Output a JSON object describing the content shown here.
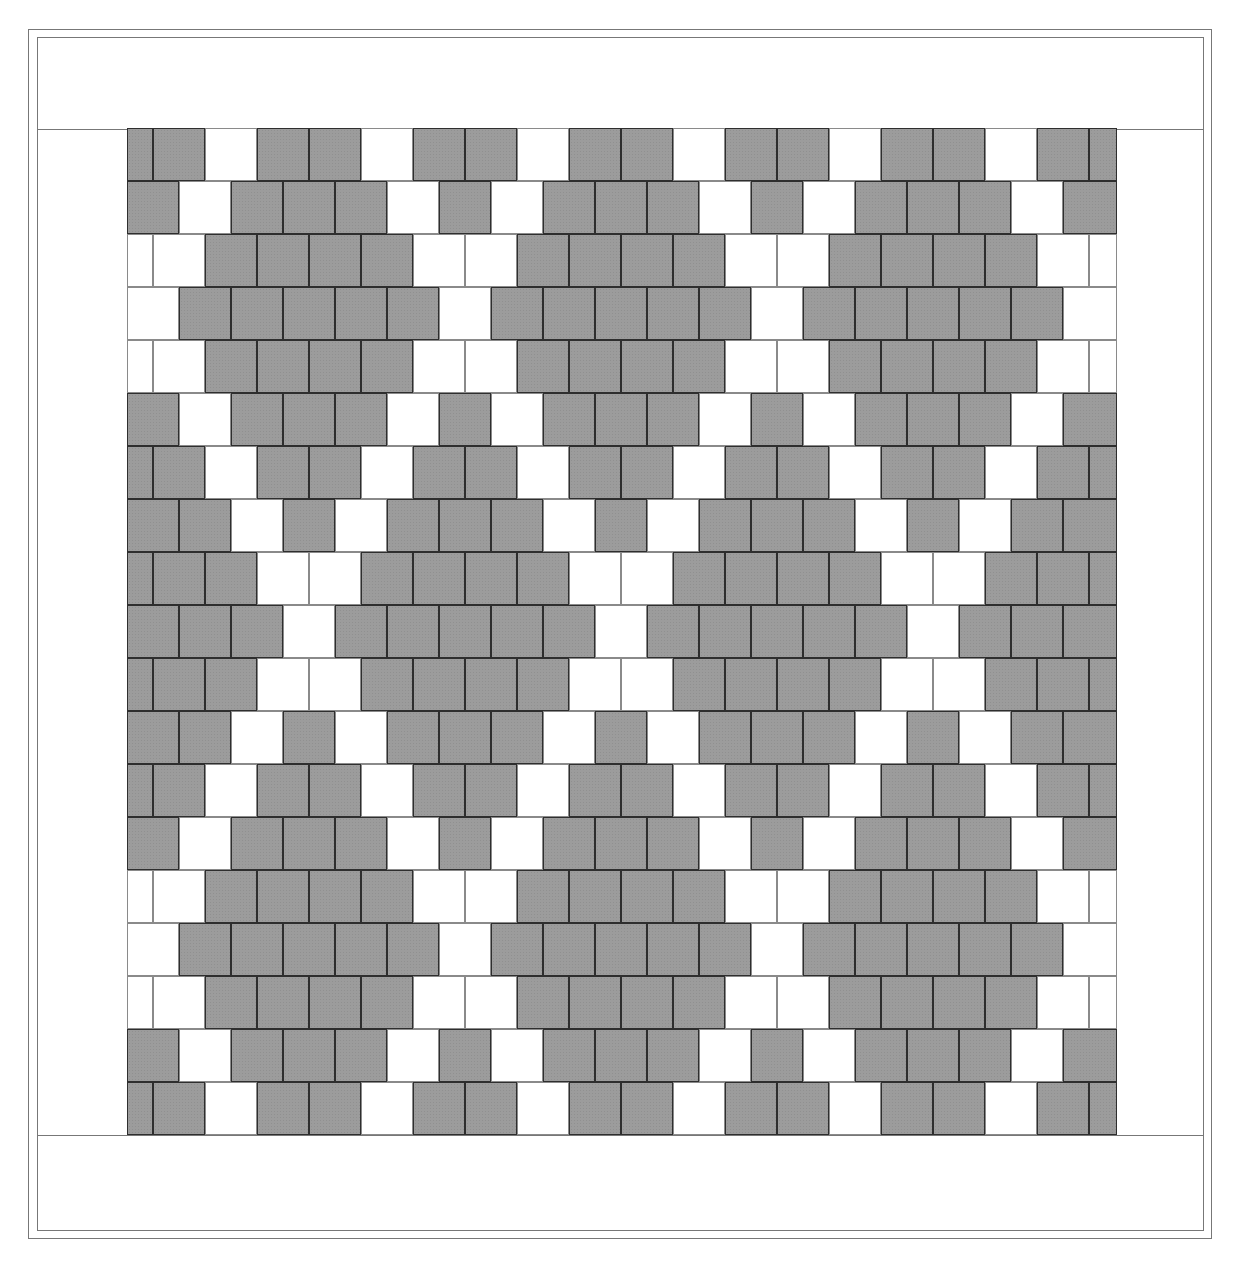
{
  "diagram": {
    "type": "tile-pattern",
    "legend": {
      "G": {
        "name": "gray tile",
        "color": "#9c9c9c"
      },
      "W": {
        "name": "white tile",
        "color": "#ffffff"
      }
    },
    "grid": {
      "row_count": 19,
      "rows": [
        {
          "half_start": true,
          "tiles": "GGWGGWGGWGGWGGWGGWGG"
        },
        {
          "half_start": false,
          "tiles": "GWGGGWGWGGGWGWGGGWG"
        },
        {
          "half_start": true,
          "tiles": "WWGGGGWWGGGGWWGGGGWW"
        },
        {
          "half_start": false,
          "tiles": "WGGGGGWGGGGGWGGGGGW"
        },
        {
          "half_start": true,
          "tiles": "WWGGGGWWGGGGWWGGGGWW"
        },
        {
          "half_start": false,
          "tiles": "GWGGGWGWGGGWGWGGGWG"
        },
        {
          "half_start": true,
          "tiles": "GGWGGWGGWGGWGGWGGWGG"
        },
        {
          "half_start": false,
          "tiles": "GGWGWGGGWGWGGGWGWGG"
        },
        {
          "half_start": true,
          "tiles": "GGGWWGGGGWWGGGGWWGGG"
        },
        {
          "half_start": false,
          "tiles": "GGGWGGGGGWGGGGGWGGG"
        },
        {
          "half_start": true,
          "tiles": "GGGWWGGGGWWGGGGWWGGG"
        },
        {
          "half_start": false,
          "tiles": "GGWGWGGGWGWGGGWGWGG"
        },
        {
          "half_start": true,
          "tiles": "GGWGGWGGWGGWGGWGGWGG"
        },
        {
          "half_start": false,
          "tiles": "GWGGGWGWGGGWGWGGGWG"
        },
        {
          "half_start": true,
          "tiles": "WWGGGGWWGGGGWWGGGGWW"
        },
        {
          "half_start": false,
          "tiles": "WGGGGGWGGGGGWGGGGGW"
        },
        {
          "half_start": true,
          "tiles": "WWGGGGWWGGGGWWGGGGWW"
        },
        {
          "half_start": false,
          "tiles": "GWGGGWGWGGGWGWGGGWG"
        },
        {
          "half_start": true,
          "tiles": "GGWGGWGGWGGWGGWGGWGG"
        }
      ]
    }
  }
}
